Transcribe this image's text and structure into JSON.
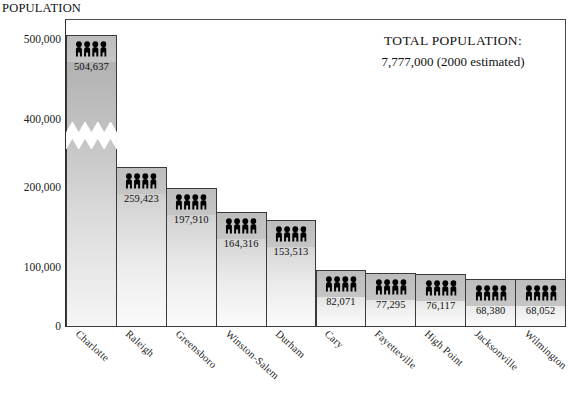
{
  "chart_data": {
    "type": "bar",
    "title": "POPULATION",
    "ylabel": "POPULATION",
    "xlabel": "",
    "grid": false,
    "legend": "none",
    "axis_break": {
      "present": true,
      "between": [
        200000,
        400000
      ]
    },
    "ylim": [
      0,
      500000
    ],
    "yticks": [
      0,
      100000,
      200000,
      400000,
      500000
    ],
    "ytick_labels": [
      "0",
      "100,000",
      "200,000",
      "400,000",
      "500,000"
    ],
    "categories": [
      "Charlotte",
      "Raleigh",
      "Greensboro",
      "Winston-Salem",
      "Durham",
      "Cary",
      "Fayetteville",
      "High Point",
      "Jacksonville",
      "Wilmington"
    ],
    "values": [
      504637,
      259423,
      197910,
      164316,
      153513,
      82071,
      77295,
      76117,
      68380,
      68052
    ],
    "value_labels": [
      "504,637",
      "259,423",
      "197,910",
      "164,316",
      "153,513",
      "82,071",
      "77,295",
      "76,117",
      "68,380",
      "68,052"
    ],
    "bar_icon": "people-group-icon",
    "annotations": [
      {
        "label": "TOTAL POPULATION:",
        "value": "7,777,000  (2000 estimated)"
      }
    ],
    "colors": {
      "bar_top": "#b8b8b8",
      "bar_bottom": "#fbfbfb",
      "bar_border": "#3a3a3a",
      "icon": "#000000",
      "text": "#111111",
      "background": "#ffffff"
    }
  },
  "annotation": {
    "total_label": "TOTAL POPULATION:",
    "total_value": "7,777,000  (2000 estimated)"
  }
}
